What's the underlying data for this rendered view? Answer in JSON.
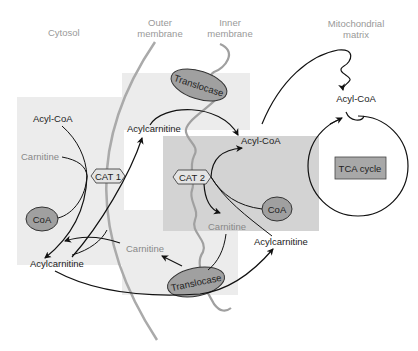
{
  "regions": {
    "cytosol": "Cytosol",
    "outer_membrane_1": "Outer",
    "outer_membrane_2": "membrane",
    "inner_membrane_1": "Inner",
    "inner_membrane_2": "membrane",
    "matrix_1": "Mitochondrial",
    "matrix_2": "matrix"
  },
  "enzymes": {
    "cat1": "CAT 1",
    "cat2": "CAT 2",
    "translocase_top": "Translocase",
    "translocase_bottom": "Translocase",
    "tca": "TCA cycle"
  },
  "molecules": {
    "cyto_acyl_coa": "Acyl-CoA",
    "cyto_carnitine": "Carnitine",
    "cyto_coa": "CoA",
    "cyto_acylcarnitine": "Acylcarnitine",
    "ims_acylcarnitine": "Acylcarnitine",
    "ims_carnitine": "Carnitine",
    "inner_acyl_coa": "Acyl-CoA",
    "inner_coa": "CoA",
    "inner_carnitine": "Carnitine",
    "inner_acylcarnitine": "Acylcarnitine",
    "matrix_acyl_coa": "Acyl-CoA"
  },
  "colors": {
    "shade_light": "#ececec",
    "shade_dark": "#cfcfcf",
    "membrane_outer": "#aaaaaa",
    "membrane_inner": "#a0a0a0",
    "enzyme_fill": "#9a9a9a",
    "tca_fill": "#a8a8a8"
  }
}
